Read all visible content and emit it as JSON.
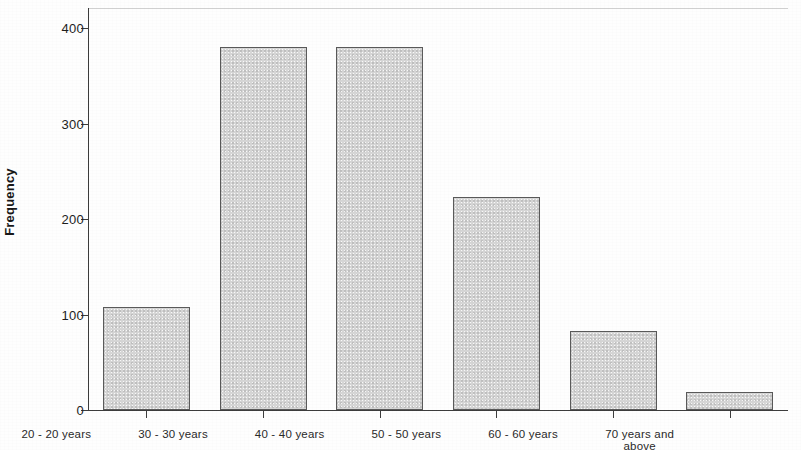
{
  "chart_data": {
    "type": "bar",
    "title": "",
    "xlabel": "",
    "ylabel": "Frequency",
    "categories": [
      "20 - 20 years",
      "30 - 30 years",
      "40 - 40 years",
      "50 - 50 years",
      "60 - 60 years",
      "70 years and\nabove"
    ],
    "values": [
      108,
      380,
      380,
      223,
      83,
      19
    ],
    "ylim": [
      0,
      420
    ],
    "yticks": [
      0,
      100,
      200,
      300,
      400
    ],
    "ytick_labels": [
      "0",
      "100",
      "200",
      "300",
      "400"
    ],
    "grid": false,
    "legend": null,
    "bar_fill_color": "#d6d6d6",
    "bar_edge_color": "#5a5a5a",
    "axis_color": "#3d3d3d",
    "background_color": "#ffffff"
  },
  "axis": {
    "y_title": "Frequency"
  }
}
